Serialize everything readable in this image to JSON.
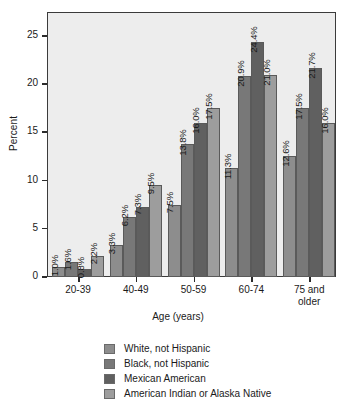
{
  "chart_data": {
    "type": "bar",
    "title": "",
    "xlabel": "Age (years)",
    "ylabel": "Percent",
    "categories": [
      "20-39",
      "40-49",
      "50-59",
      "60-74",
      "75 and\nolder"
    ],
    "ylim": [
      0,
      27.5
    ],
    "yticks": [
      0,
      5,
      10,
      15,
      20,
      25
    ],
    "ytick_labels": [
      "0",
      "5",
      "10",
      "15",
      "20",
      "25"
    ],
    "grid": false,
    "legend_position": "bottom",
    "value_label_suffix": "%",
    "series": [
      {
        "name": "White, not Hispanic",
        "color": "#8d8d8d",
        "values": [
          1.0,
          3.3,
          7.5,
          11.3,
          12.6
        ],
        "labels": [
          "1.0%",
          "3.3%",
          "7.5%",
          "11.3%",
          "12.6%"
        ]
      },
      {
        "name": "Black, not Hispanic",
        "color": "#787878",
        "values": [
          1.6,
          6.2,
          13.8,
          20.9,
          17.5
        ],
        "labels": [
          "1.6%",
          "6.2%",
          "13.8%",
          "20.9%",
          "17.5%"
        ]
      },
      {
        "name": "Mexican American",
        "color": "#606060",
        "values": [
          0.8,
          7.3,
          16.0,
          24.4,
          21.7
        ],
        "labels": [
          "0.8%",
          "7.3%",
          "16.0%",
          "24.4%",
          "21.7%"
        ]
      },
      {
        "name": "American Indian or Alaska Native",
        "color": "#9d9d9d",
        "values": [
          2.2,
          9.5,
          17.5,
          21.0,
          16.0
        ],
        "labels": [
          "2.2%",
          "9.5%",
          "17.5%",
          "21.0%",
          "16.0%"
        ]
      }
    ]
  }
}
